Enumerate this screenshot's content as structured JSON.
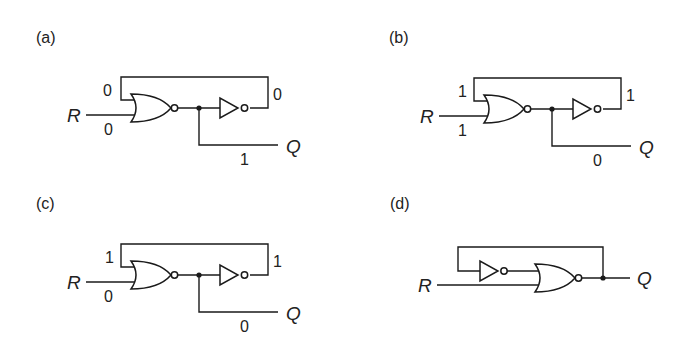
{
  "figure": {
    "panels": [
      {
        "id": "a",
        "label": "(a)",
        "input_name": "R",
        "output_name": "Q",
        "values": {
          "feedback_in": "0",
          "r_in": "0",
          "inverter_out": "0",
          "q_out": "1"
        }
      },
      {
        "id": "b",
        "label": "(b)",
        "input_name": "R",
        "output_name": "Q",
        "values": {
          "feedback_in": "1",
          "r_in": "1",
          "inverter_out": "1",
          "q_out": "0"
        }
      },
      {
        "id": "c",
        "label": "(c)",
        "input_name": "R",
        "output_name": "Q",
        "values": {
          "feedback_in": "1",
          "r_in": "0",
          "inverter_out": "1",
          "q_out": "0"
        }
      },
      {
        "id": "d",
        "label": "(d)",
        "input_name": "R",
        "output_name": "Q"
      }
    ]
  }
}
